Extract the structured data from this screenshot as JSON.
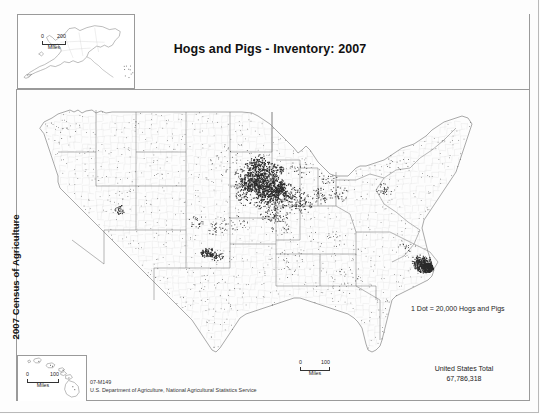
{
  "document": {
    "title": "Hogs and Pigs - Inventory:  2007",
    "spine_label": "2007 Census of Agriculture",
    "map_number": "07-M149",
    "source_agency": "U.S. Department of Agriculture, National Agricultural Statistics Service"
  },
  "legend": {
    "dot_value_text": "1 Dot = 20,000 Hogs and Pigs",
    "total_label": "United States Total",
    "total_value": "67,786,318"
  },
  "scalebars": {
    "alaska": {
      "min": "0",
      "max": "200",
      "unit": "Miles"
    },
    "hawaii": {
      "min": "0",
      "max": "100",
      "unit": "Miles"
    },
    "main": {
      "min": "0",
      "max": "100",
      "unit": "Miles"
    }
  },
  "colors": {
    "dot": "#2b2b2b",
    "state_outline": "#6b6b6b",
    "county_outline": "#d2d2d2",
    "frame": "#9a9a9a",
    "text": "#1a1a1a",
    "background": "#ffffff"
  },
  "chart_data": {
    "type": "map",
    "subtype": "dot-density-choropleth",
    "title": "Hogs and Pigs - Inventory:  2007",
    "dot_value": 20000,
    "dot_unit": "Hogs and Pigs",
    "national_total": 67786318,
    "insets": [
      "Alaska",
      "Hawaii"
    ],
    "projection": "Albers equal area (conterminous U.S.)",
    "geography_level": "county",
    "state_intensity": [
      {
        "state": "Iowa",
        "weight": 1.0
      },
      {
        "state": "North Carolina",
        "weight": 0.72
      },
      {
        "state": "Minnesota",
        "weight": 0.66
      },
      {
        "state": "Illinois",
        "weight": 0.42
      },
      {
        "state": "Indiana",
        "weight": 0.33
      },
      {
        "state": "Nebraska",
        "weight": 0.31
      },
      {
        "state": "Missouri",
        "weight": 0.29
      },
      {
        "state": "Oklahoma",
        "weight": 0.27
      },
      {
        "state": "Ohio",
        "weight": 0.22
      },
      {
        "state": "Kansas",
        "weight": 0.2
      },
      {
        "state": "South Dakota",
        "weight": 0.18
      },
      {
        "state": "Texas",
        "weight": 0.12
      },
      {
        "state": "Michigan",
        "weight": 0.11
      },
      {
        "state": "Pennsylvania",
        "weight": 0.11
      },
      {
        "state": "Wisconsin",
        "weight": 0.1
      },
      {
        "state": "Colorado",
        "weight": 0.08
      },
      {
        "state": "Virginia",
        "weight": 0.07
      },
      {
        "state": "Kentucky",
        "weight": 0.06
      },
      {
        "state": "Utah",
        "weight": 0.05
      },
      {
        "state": "Arkansas",
        "weight": 0.05
      },
      {
        "state": "Georgia",
        "weight": 0.05
      },
      {
        "state": "Alabama",
        "weight": 0.04
      },
      {
        "state": "Mississippi",
        "weight": 0.04
      },
      {
        "state": "Tennessee",
        "weight": 0.04
      },
      {
        "state": "California",
        "weight": 0.03
      },
      {
        "state": "Montana",
        "weight": 0.03
      },
      {
        "state": "North Dakota",
        "weight": 0.03
      }
    ],
    "dot_clusters": [
      {
        "name": "north-central Iowa",
        "cx": 268,
        "cy": 186,
        "rx": 17,
        "ry": 13,
        "n": 300,
        "size": 1.5
      },
      {
        "name": "northwest Iowa",
        "cx": 253,
        "cy": 182,
        "rx": 12,
        "ry": 10,
        "n": 190,
        "size": 1.5
      },
      {
        "name": "southern Minnesota",
        "cx": 266,
        "cy": 170,
        "rx": 18,
        "ry": 8,
        "n": 150,
        "size": 1.4
      },
      {
        "name": "central Iowa",
        "cx": 272,
        "cy": 195,
        "rx": 16,
        "ry": 10,
        "n": 150,
        "size": 1.4
      },
      {
        "name": "east-central Iowa",
        "cx": 286,
        "cy": 192,
        "rx": 11,
        "ry": 9,
        "n": 85,
        "size": 1.3
      },
      {
        "name": "southwest Minnesota",
        "cx": 255,
        "cy": 166,
        "rx": 10,
        "ry": 8,
        "n": 80,
        "size": 1.3
      },
      {
        "name": "southern Iowa",
        "cx": 271,
        "cy": 204,
        "rx": 17,
        "ry": 7,
        "n": 70,
        "size": 1.2
      },
      {
        "name": "northern Missouri",
        "cx": 275,
        "cy": 215,
        "rx": 16,
        "ry": 8,
        "n": 55,
        "size": 1.2
      },
      {
        "name": "western Illinois",
        "cx": 297,
        "cy": 200,
        "rx": 10,
        "ry": 12,
        "n": 60,
        "size": 1.2
      },
      {
        "name": "central Illinois",
        "cx": 305,
        "cy": 203,
        "rx": 9,
        "ry": 11,
        "n": 45,
        "size": 1.1
      },
      {
        "name": "northern Indiana",
        "cx": 320,
        "cy": 196,
        "rx": 9,
        "ry": 8,
        "n": 40,
        "size": 1.1
      },
      {
        "name": "eastern Nebraska",
        "cx": 246,
        "cy": 195,
        "rx": 10,
        "ry": 11,
        "n": 55,
        "size": 1.2
      },
      {
        "name": "northeast Nebraska",
        "cx": 243,
        "cy": 186,
        "rx": 9,
        "ry": 7,
        "n": 35,
        "size": 1.1
      },
      {
        "name": "southern Minnesota west",
        "cx": 259,
        "cy": 160,
        "rx": 8,
        "ry": 6,
        "n": 40,
        "size": 1.2
      },
      {
        "name": "southeast South Dakota",
        "cx": 244,
        "cy": 174,
        "rx": 9,
        "ry": 7,
        "n": 35,
        "size": 1.1
      },
      {
        "name": "NC coastal plain",
        "cx": 425,
        "cy": 265,
        "rx": 11,
        "ry": 8,
        "n": 200,
        "size": 1.5
      },
      {
        "name": "NC Duplin-Sampson",
        "cx": 428,
        "cy": 268,
        "rx": 6,
        "ry": 5,
        "n": 130,
        "size": 1.6
      },
      {
        "name": "NC inner coastal",
        "cx": 419,
        "cy": 261,
        "rx": 8,
        "ry": 6,
        "n": 70,
        "size": 1.3
      },
      {
        "name": "Texas/Oklahoma panhandle",
        "cx": 208,
        "cy": 253,
        "rx": 7,
        "ry": 5,
        "n": 75,
        "size": 1.4
      },
      {
        "name": "western Oklahoma",
        "cx": 216,
        "cy": 256,
        "rx": 8,
        "ry": 5,
        "n": 40,
        "size": 1.2
      },
      {
        "name": "central Utah",
        "cx": 120,
        "cy": 210,
        "rx": 5,
        "ry": 5,
        "n": 28,
        "size": 1.3
      },
      {
        "name": "eastern Colorado",
        "cx": 196,
        "cy": 222,
        "rx": 8,
        "ry": 7,
        "n": 25,
        "size": 1.1
      },
      {
        "name": "northern Ohio",
        "cx": 339,
        "cy": 194,
        "rx": 10,
        "ry": 9,
        "n": 35,
        "size": 1.1
      },
      {
        "name": "southeast Pennsylvania",
        "cx": 385,
        "cy": 190,
        "rx": 9,
        "ry": 7,
        "n": 32,
        "size": 1.1
      },
      {
        "name": "southern Michigan",
        "cx": 327,
        "cy": 178,
        "rx": 10,
        "ry": 6,
        "n": 25,
        "size": 1.1
      },
      {
        "name": "central Kansas",
        "cx": 232,
        "cy": 224,
        "rx": 16,
        "ry": 9,
        "n": 35,
        "size": 1.0
      },
      {
        "name": "southwest Kansas",
        "cx": 215,
        "cy": 229,
        "rx": 9,
        "ry": 6,
        "n": 25,
        "size": 1.1
      },
      {
        "name": "Virginia southside",
        "cx": 407,
        "cy": 247,
        "rx": 9,
        "ry": 5,
        "n": 18,
        "size": 1.0
      },
      {
        "name": "central Missouri",
        "cx": 281,
        "cy": 226,
        "rx": 13,
        "ry": 9,
        "n": 28,
        "size": 1.0
      },
      {
        "name": "Arkansas/Mississippi",
        "cx": 292,
        "cy": 262,
        "rx": 14,
        "ry": 14,
        "n": 22,
        "size": 0.9
      },
      {
        "name": "Georgia/Alabama",
        "cx": 350,
        "cy": 280,
        "rx": 18,
        "ry": 16,
        "n": 22,
        "size": 0.9
      },
      {
        "name": "Wisconsin",
        "cx": 299,
        "cy": 168,
        "rx": 12,
        "ry": 12,
        "n": 28,
        "size": 1.0
      },
      {
        "name": "central California",
        "cx": 58,
        "cy": 220,
        "rx": 7,
        "ry": 13,
        "n": 14,
        "size": 0.9
      },
      {
        "name": "Washington/Oregon",
        "cx": 60,
        "cy": 128,
        "rx": 20,
        "ry": 16,
        "n": 14,
        "size": 0.9
      },
      {
        "name": "Dakotas scatter",
        "cx": 228,
        "cy": 160,
        "rx": 24,
        "ry": 18,
        "n": 30,
        "size": 0.9
      },
      {
        "name": "New York/New England",
        "cx": 392,
        "cy": 165,
        "rx": 18,
        "ry": 14,
        "n": 16,
        "size": 0.9
      },
      {
        "name": "Kentucky/Tennessee",
        "cx": 330,
        "cy": 238,
        "rx": 22,
        "ry": 10,
        "n": 22,
        "size": 0.9
      },
      {
        "name": "Texas central",
        "cx": 220,
        "cy": 290,
        "rx": 26,
        "ry": 22,
        "n": 26,
        "size": 0.85
      },
      {
        "name": "Intermountain West",
        "cx": 130,
        "cy": 185,
        "rx": 38,
        "ry": 40,
        "n": 18,
        "size": 0.8
      },
      {
        "name": "Florida",
        "cx": 385,
        "cy": 320,
        "rx": 10,
        "ry": 20,
        "n": 12,
        "size": 0.85
      },
      {
        "name": "Alaska inset",
        "cx": 112,
        "cy": 58,
        "rx": 6,
        "ry": 8,
        "n": 10,
        "size": 0.9,
        "space": "alaska"
      },
      {
        "name": "Hawaii inset",
        "cx": 55,
        "cy": 372,
        "rx": 7,
        "ry": 5,
        "n": 5,
        "size": 0.85,
        "space": "page"
      }
    ]
  }
}
